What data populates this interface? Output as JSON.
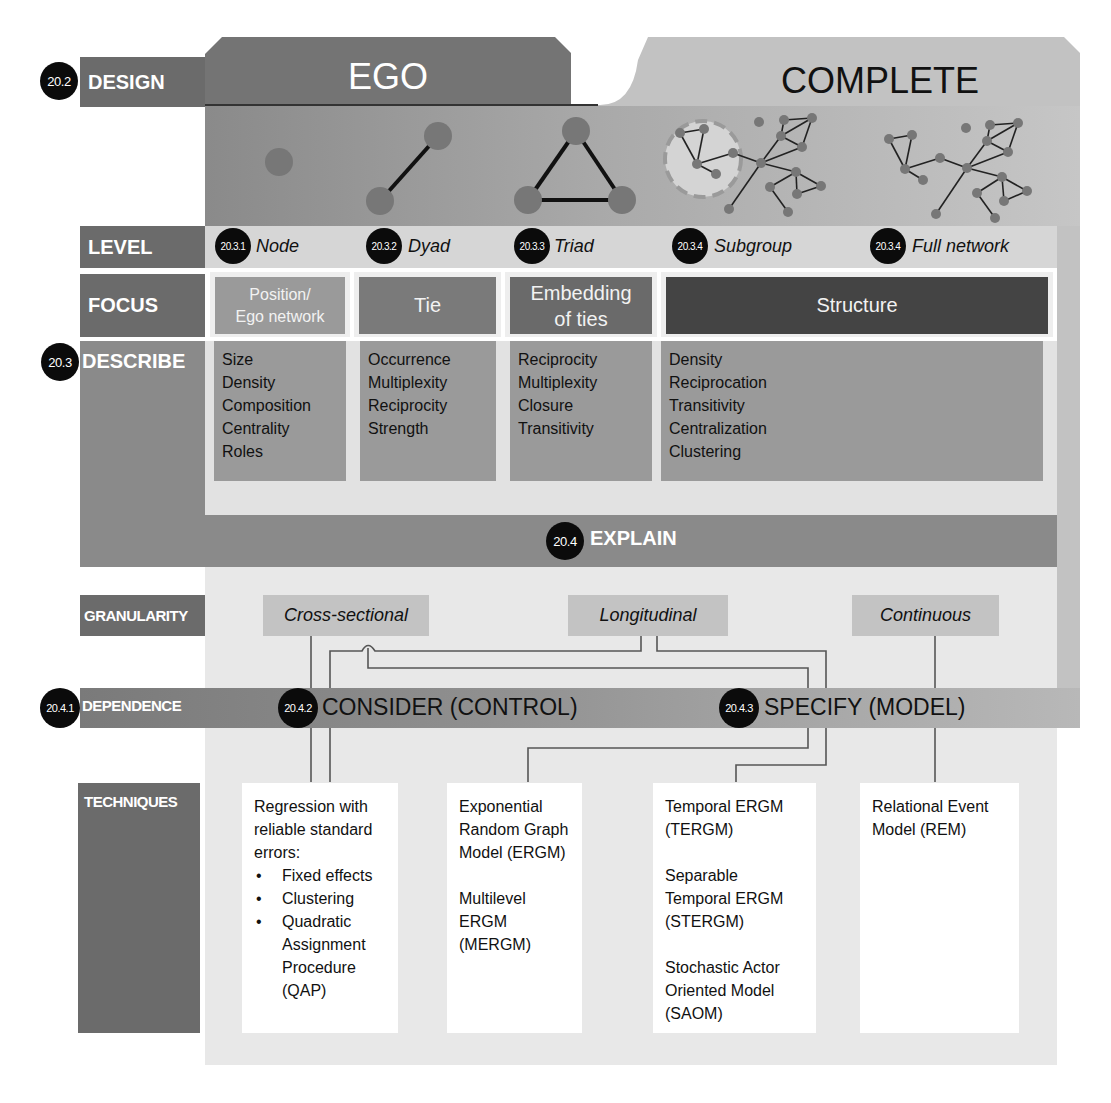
{
  "design": {
    "badge": "20.2",
    "label": "DESIGN",
    "ego_title": "EGO",
    "complete_title": "COMPLETE"
  },
  "level": {
    "label": "LEVEL",
    "items": [
      {
        "badge": "20.3.1",
        "label": "Node"
      },
      {
        "badge": "20.3.2",
        "label": "Dyad"
      },
      {
        "badge": "20.3.3",
        "label": "Triad"
      },
      {
        "badge": "20.3.4",
        "label": "Subgroup"
      },
      {
        "badge": "20.3.4",
        "label": "Full network"
      }
    ]
  },
  "focus": {
    "label": "FOCUS",
    "items": [
      {
        "line1": "Position/",
        "line2": "Ego network"
      },
      {
        "line1": "Tie",
        "line2": ""
      },
      {
        "line1": "Embedding",
        "line2": "of ties"
      },
      {
        "line1": "Structure",
        "line2": ""
      }
    ]
  },
  "describe": {
    "badge": "20.3",
    "label": "DESCRIBE",
    "columns": [
      [
        "Size",
        "Density",
        "Composition",
        "Centrality",
        "Roles"
      ],
      [
        "Occurrence",
        "Multiplexity",
        "Reciprocity",
        "Strength"
      ],
      [
        "Reciprocity",
        "Multiplexity",
        "Closure",
        "Transitivity"
      ],
      [
        "Density",
        "Reciprocation",
        "Transitivity",
        "Centralization",
        "Clustering"
      ]
    ]
  },
  "explain": {
    "badge": "20.4",
    "label": "EXPLAIN"
  },
  "granularity": {
    "label": "GRANULARITY",
    "items": [
      "Cross-sectional",
      "Longitudinal",
      "Continuous"
    ]
  },
  "dependence": {
    "badge": "20.4.1",
    "label": "DEPENDENCE",
    "consider_badge": "20.4.2",
    "consider_label": "CONSIDER (CONTROL)",
    "specify_badge": "20.4.3",
    "specify_label": "SPECIFY (MODEL)"
  },
  "techniques": {
    "label": "TECHNIQUES",
    "regression": {
      "intro": "Regression with reliable standard errors:",
      "bullets": [
        "Fixed effects",
        "Clustering",
        "Quadratic Assignment Procedure (QAP)"
      ]
    },
    "ergm": [
      "Exponential Random Graph Model (ERGM)",
      "Multilevel ERGM (MERGM)"
    ],
    "temporal": [
      "Temporal ERGM (TERGM)",
      "Separable Temporal ERGM (STERGM)",
      "Stochastic Actor Oriented Model (SAOM)"
    ],
    "rem": [
      "Relational Event Model (REM)"
    ]
  },
  "colors": {
    "row_label": "#6b6b6b",
    "ego_header": "#747474",
    "complete_panel": "#c2c2c2",
    "inner_panel": "#e4e4e4",
    "describe_box": "#9a9a9a",
    "structure_box": "#444444",
    "badge": "#0b0b0b",
    "node": "#777777"
  }
}
